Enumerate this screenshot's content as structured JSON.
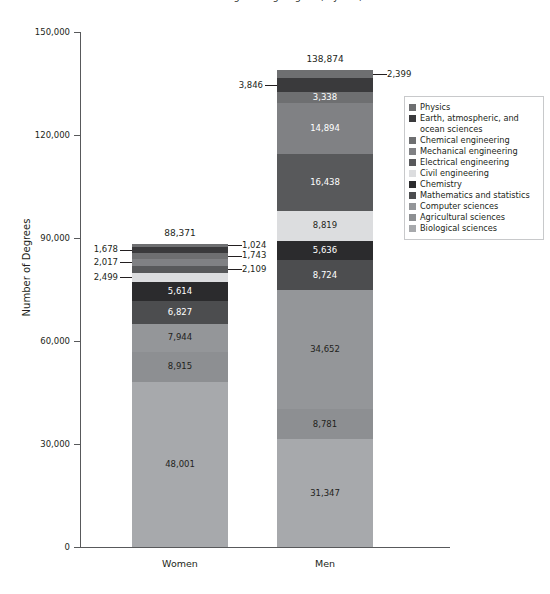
{
  "chart_data": {
    "type": "bar",
    "subtype": "stacked-bar",
    "title": "Science and Engineering Degrees, by Sex, 2016",
    "xlabel": "",
    "ylabel": "Number of Degrees",
    "categories": [
      "Women",
      "Men"
    ],
    "ylim": [
      0,
      150000
    ],
    "ytick_values": [
      0,
      30000,
      60000,
      90000,
      120000,
      150000
    ],
    "ytick_labels": [
      "0",
      "30,000",
      "60,000",
      "90,000",
      "120,000",
      "150,000"
    ],
    "grid": false,
    "legend_position": "right",
    "totals": {
      "Women": "88,371",
      "Men": "138,874"
    },
    "total_values": {
      "Women": 88371,
      "Men": 138874
    },
    "series": [
      {
        "name": "Physics",
        "color": "#6e6f71",
        "values": [
          1024,
          2399
        ],
        "labels": [
          "1,024",
          "2,399"
        ],
        "label_mode": [
          "callout-right",
          "callout-right"
        ]
      },
      {
        "name": "Earth, atmospheric, and ocean sciences",
        "color": "#3a3a3c",
        "values": [
          1678,
          3846
        ],
        "labels": [
          "1,678",
          "3,846"
        ],
        "label_mode": [
          "callout-left",
          "callout-left"
        ]
      },
      {
        "name": "Chemical engineering",
        "color": "#6e6f71",
        "values": [
          1743,
          3338
        ],
        "labels": [
          "1,743",
          "3,338"
        ],
        "label_mode": [
          "callout-right",
          "inside-light"
        ]
      },
      {
        "name": "Mechanical engineering",
        "color": "#808184",
        "values": [
          2017,
          14894
        ],
        "labels": [
          "2,017",
          "14,894"
        ],
        "label_mode": [
          "callout-left",
          "inside-light"
        ]
      },
      {
        "name": "Electrical engineering",
        "color": "#58595b",
        "values": [
          2109,
          16438
        ],
        "labels": [
          "2,109",
          "16,438"
        ],
        "label_mode": [
          "callout-right",
          "inside-light"
        ]
      },
      {
        "name": "Civil engineering",
        "color": "#dcdddf",
        "values": [
          2499,
          8819
        ],
        "labels": [
          "2,499",
          "8,819"
        ],
        "label_mode": [
          "callout-left",
          "inside-dark"
        ]
      },
      {
        "name": "Chemistry",
        "color": "#2b2b2d",
        "values": [
          5614,
          5636
        ],
        "labels": [
          "5,614",
          "5,636"
        ],
        "label_mode": [
          "inside-light",
          "inside-light"
        ]
      },
      {
        "name": "Mathematics and statistics",
        "color": "#4c4d4f",
        "values": [
          6827,
          8724
        ],
        "labels": [
          "6,827",
          "8,724"
        ],
        "label_mode": [
          "inside-light",
          "inside-light"
        ]
      },
      {
        "name": "Computer sciences",
        "color": "#949699",
        "values": [
          7944,
          34652
        ],
        "labels": [
          "7,944",
          "34,652"
        ],
        "label_mode": [
          "inside-dark",
          "inside-dark"
        ]
      },
      {
        "name": "Agricultural sciences",
        "color": "#8d8f92",
        "values": [
          8915,
          8781
        ],
        "labels": [
          "8,915",
          "8,781"
        ],
        "label_mode": [
          "inside-dark",
          "inside-dark"
        ]
      },
      {
        "name": "Biological sciences",
        "color": "#a7a9ac",
        "values": [
          48001,
          31347
        ],
        "labels": [
          "48,001",
          "31,347"
        ],
        "label_mode": [
          "inside-dark",
          "inside-dark"
        ]
      }
    ]
  },
  "axis": {
    "y_title": "Number of Degrees"
  },
  "legend": {
    "items": [
      {
        "label": "Physics",
        "color": "#6e6f71"
      },
      {
        "label": "Earth, atmospheric, and ocean sciences",
        "color": "#3a3a3c"
      },
      {
        "label": "Chemical engineering",
        "color": "#6e6f71"
      },
      {
        "label": "Mechanical engineering",
        "color": "#808184"
      },
      {
        "label": "Electrical engineering",
        "color": "#58595b"
      },
      {
        "label": "Civil engineering",
        "color": "#dcdddf"
      },
      {
        "label": "Chemistry",
        "color": "#2b2b2d"
      },
      {
        "label": "Mathematics and statistics",
        "color": "#4c4d4f"
      },
      {
        "label": "Computer sciences",
        "color": "#949699"
      },
      {
        "label": "Agricultural sciences",
        "color": "#8d8f92"
      },
      {
        "label": "Biological sciences",
        "color": "#a7a9ac"
      }
    ]
  }
}
